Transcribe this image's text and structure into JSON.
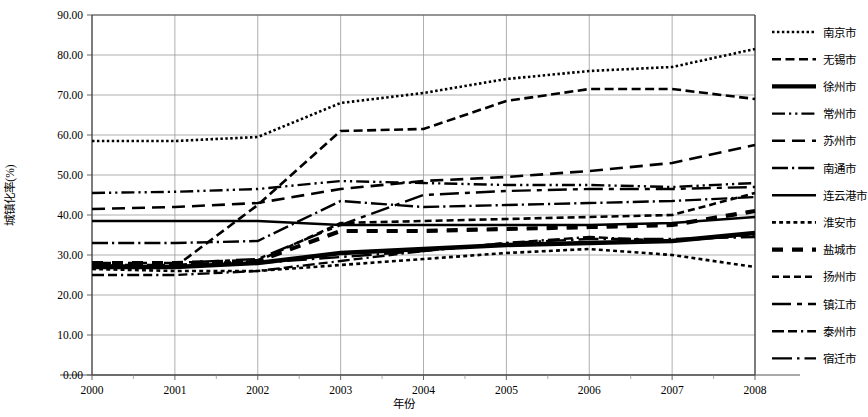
{
  "chart_data": {
    "type": "line",
    "title": "",
    "xlabel": "年份",
    "ylabel": "城镇化率(%)",
    "x": [
      2000,
      2001,
      2002,
      2003,
      2004,
      2005,
      2006,
      2007,
      2008
    ],
    "xticklabels": [
      "2000",
      "2001",
      "2002",
      "2003",
      "2004",
      "2005",
      "2006",
      "2007",
      "2008"
    ],
    "yticklabels": [
      "0.00",
      "10.00",
      "20.00",
      "30.00",
      "40.00",
      "50.00",
      "60.00",
      "70.00",
      "80.00",
      "90.00"
    ],
    "ylim": [
      0,
      90
    ],
    "ytick_step": 10,
    "xlim": [
      2000,
      2008
    ],
    "grid": "both",
    "legend_position": "right",
    "series": [
      {
        "name": "南京市",
        "dash": "dotted",
        "width": 2.6,
        "values": [
          58.5,
          58.5,
          59.5,
          68.0,
          70.5,
          74.0,
          76.0,
          77.0,
          81.5
        ]
      },
      {
        "name": "无锡市",
        "dash": "dashed",
        "width": 2.6,
        "values": [
          27.5,
          27.0,
          42.5,
          61.0,
          61.5,
          68.5,
          71.5,
          71.5,
          69.0
        ]
      },
      {
        "name": "徐州市",
        "dash": "double-solid",
        "width": 1.6,
        "values": [
          27.0,
          27.0,
          28.0,
          30.5,
          31.5,
          32.5,
          33.0,
          33.5,
          35.5
        ]
      },
      {
        "name": "常州市",
        "dash": "dash-dot-dot",
        "width": 2.4,
        "values": [
          45.5,
          45.8,
          46.5,
          48.5,
          48.0,
          47.5,
          47.5,
          47.0,
          48.0
        ]
      },
      {
        "name": "苏州市",
        "dash": "long-dash",
        "width": 2.6,
        "values": [
          41.5,
          42.0,
          43.0,
          46.5,
          48.5,
          49.5,
          51.0,
          53.0,
          57.5
        ]
      },
      {
        "name": "南通市",
        "dash": "dash-dot",
        "width": 2.4,
        "values": [
          33.0,
          33.0,
          33.5,
          43.5,
          42.0,
          42.5,
          43.0,
          43.5,
          44.5
        ]
      },
      {
        "name": "连云港市",
        "dash": "solid",
        "width": 2.4,
        "values": [
          38.5,
          38.5,
          38.5,
          37.5,
          37.5,
          37.5,
          37.5,
          38.0,
          39.5
        ]
      },
      {
        "name": "淮安市",
        "dash": "square-dotted",
        "width": 2.6,
        "values": [
          26.5,
          26.0,
          26.0,
          27.5,
          29.0,
          30.5,
          31.5,
          30.0,
          27.0
        ]
      },
      {
        "name": "盐城市",
        "dash": "double-dash",
        "width": 1.6,
        "values": [
          28.0,
          28.0,
          28.5,
          36.0,
          36.0,
          36.5,
          37.0,
          37.5,
          41.0
        ]
      },
      {
        "name": "扬州市",
        "dash": "square-dash",
        "width": 2.6,
        "values": [
          27.5,
          27.5,
          28.5,
          38.0,
          38.5,
          39.0,
          39.5,
          40.0,
          45.5
        ]
      },
      {
        "name": "镇江市",
        "dash": "dash-square",
        "width": 2.4,
        "values": [
          28.0,
          28.0,
          29.0,
          37.5,
          45.0,
          46.0,
          46.5,
          46.5,
          47.0
        ]
      },
      {
        "name": "泰州市",
        "dash": "dash-dash-dot",
        "width": 2.4,
        "values": [
          25.0,
          25.0,
          26.0,
          28.5,
          31.0,
          33.0,
          34.5,
          33.5,
          35.0
        ]
      },
      {
        "name": "宿迁市",
        "dash": "long-dash-dot",
        "width": 2.4,
        "values": [
          27.0,
          27.0,
          28.0,
          29.5,
          31.0,
          33.0,
          34.0,
          34.0,
          34.5
        ]
      }
    ]
  }
}
